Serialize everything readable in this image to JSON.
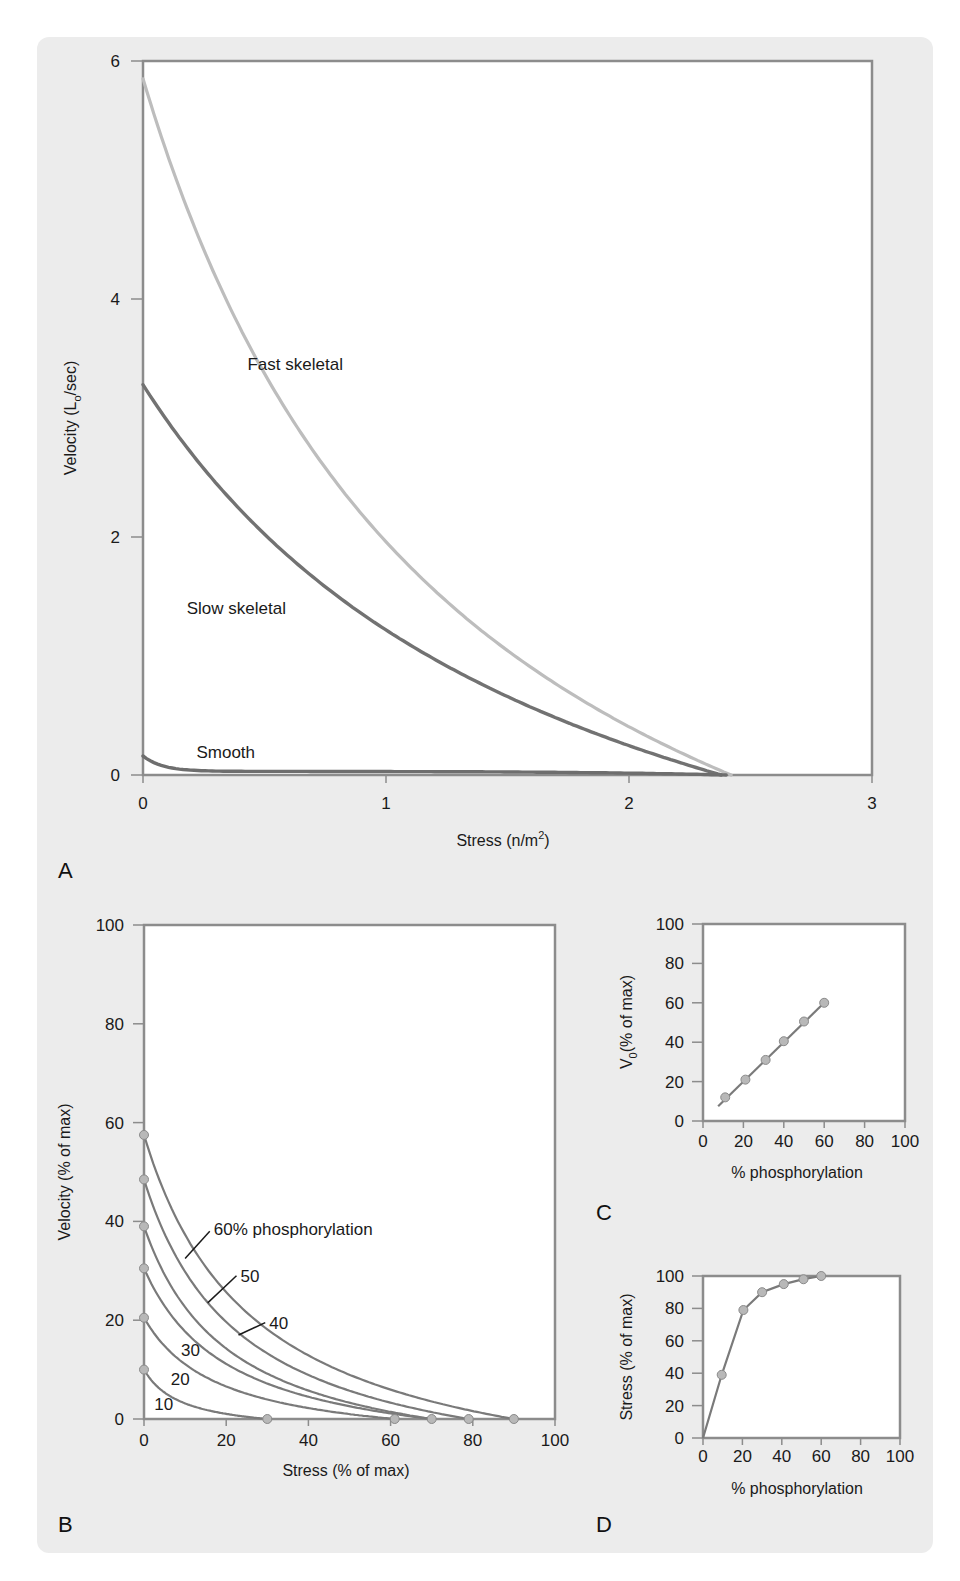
{
  "figure": {
    "background": "#ececec",
    "axis_color": "#8c8c8c",
    "curve_color": "#7a7a7a",
    "fast_color": "#bdbdbd",
    "slow_color": "#727272",
    "smooth_color": "#6e6e6e"
  },
  "chart_data": [
    {
      "id": "A",
      "panel_letter": "A",
      "type": "line",
      "title": "",
      "xlabel": "Stress (n/m",
      "xlabel_sup": "2",
      "xlabel_end": ")",
      "ylabel": "Velocity (L",
      "ylabel_sub": "o",
      "ylabel_end": "/sec)",
      "xlim": [
        0,
        3
      ],
      "ylim": [
        0,
        6
      ],
      "xticks": [
        0,
        1,
        2,
        3
      ],
      "yticks": [
        0,
        2,
        4,
        6
      ],
      "grid": false,
      "series": [
        {
          "name": "Fast skeletal",
          "v0": 5.85,
          "f0": 2.42,
          "a": 0.55,
          "color": "#bdbdbd",
          "x": [
            0,
            0.25,
            0.5,
            1.0,
            1.5,
            2.0,
            2.42
          ],
          "y": [
            5.85,
            4.1,
            2.95,
            1.6,
            0.8,
            0.3,
            0
          ]
        },
        {
          "name": "Slow skeletal",
          "v0": 3.28,
          "f0": 2.38,
          "a": 0.75,
          "color": "#727272",
          "x": [
            0,
            0.25,
            0.5,
            1.0,
            1.5,
            2.0,
            2.38
          ],
          "y": [
            3.28,
            2.5,
            1.95,
            1.1,
            0.55,
            0.18,
            0
          ]
        },
        {
          "name": "Smooth",
          "v0": 0.16,
          "f0": 2.4,
          "a": 0.03,
          "color": "#6e6e6e",
          "x": [
            0,
            0.1,
            0.3,
            1.0,
            2.0,
            2.4
          ],
          "y": [
            0.16,
            0.07,
            0.04,
            0.03,
            0.01,
            0
          ]
        }
      ],
      "annotations": [
        {
          "text": "Fast skeletal",
          "x": 0.43,
          "y": 3.45
        },
        {
          "text": "Slow skeletal",
          "x": 0.18,
          "y": 1.4
        },
        {
          "text": "Smooth",
          "x": 0.22,
          "y": 0.19
        }
      ]
    },
    {
      "id": "B",
      "panel_letter": "B",
      "type": "line",
      "title": "",
      "xlabel": "Stress (% of max)",
      "ylabel": "Velocity (% of max)",
      "xlim": [
        0,
        100
      ],
      "ylim": [
        0,
        100
      ],
      "xticks": [
        0,
        20,
        40,
        60,
        80,
        100
      ],
      "yticks": [
        0,
        20,
        40,
        60,
        80,
        100
      ],
      "grid": false,
      "series": [
        {
          "name": "10",
          "v0": 10,
          "f0": 30,
          "a": 0.3
        },
        {
          "name": "20",
          "v0": 20.5,
          "f0": 61,
          "a": 0.3
        },
        {
          "name": "30",
          "v0": 30.5,
          "f0": 70,
          "a": 0.3
        },
        {
          "name": "40",
          "v0": 39,
          "f0": 70,
          "a": 0.3
        },
        {
          "name": "50",
          "v0": 48.5,
          "f0": 79,
          "a": 0.3
        },
        {
          "name": "60% phosphorylation",
          "v0": 57.5,
          "f0": 90,
          "a": 0.3
        }
      ],
      "endpoint_markers": [
        {
          "x": 0,
          "y": 10
        },
        {
          "x": 0,
          "y": 20.5
        },
        {
          "x": 0,
          "y": 30.5
        },
        {
          "x": 0,
          "y": 39
        },
        {
          "x": 0,
          "y": 48.5
        },
        {
          "x": 0,
          "y": 57.5
        },
        {
          "x": 30,
          "y": 0
        },
        {
          "x": 61,
          "y": 0
        },
        {
          "x": 70,
          "y": 0
        },
        {
          "x": 79,
          "y": 0
        },
        {
          "x": 90,
          "y": 0
        }
      ],
      "labels": [
        {
          "text": "60% phosphorylation",
          "x": 17,
          "y": 38.5,
          "leader": [
            [
              10,
              32.5
            ],
            [
              16,
              38
            ]
          ]
        },
        {
          "text": "50",
          "x": 23.5,
          "y": 29,
          "leader": [
            [
              15.5,
              23.5
            ],
            [
              22.5,
              29
            ]
          ]
        },
        {
          "text": "40",
          "x": 30.5,
          "y": 19.5,
          "leader": [
            [
              23,
              17
            ],
            [
              29.5,
              19.5
            ]
          ]
        },
        {
          "text": "30",
          "x": 9,
          "y": 14
        },
        {
          "text": "20",
          "x": 6.5,
          "y": 8
        },
        {
          "text": "10",
          "x": 2.5,
          "y": 3
        }
      ]
    },
    {
      "id": "C",
      "panel_letter": "C",
      "type": "scatter",
      "title": "",
      "xlabel": "% phosphorylation",
      "ylabel": "V",
      "ylabel_sub": "0",
      "ylabel_end": "(% of max)",
      "xlim": [
        0,
        100
      ],
      "ylim": [
        0,
        100
      ],
      "xticks": [
        0,
        20,
        40,
        60,
        80,
        100
      ],
      "yticks": [
        0,
        20,
        40,
        60,
        80,
        100
      ],
      "grid": false,
      "x": [
        11,
        21,
        31,
        40,
        50,
        60
      ],
      "y": [
        12,
        21,
        31,
        40.5,
        50.5,
        60
      ],
      "fit_line": [
        [
          7.5,
          7.5
        ],
        [
          60,
          60
        ]
      ]
    },
    {
      "id": "D",
      "panel_letter": "D",
      "type": "line",
      "title": "",
      "xlabel": "% phosphorylation",
      "ylabel": "Stress (% of max)",
      "xlim": [
        0,
        100
      ],
      "ylim": [
        0,
        100
      ],
      "xticks": [
        0,
        20,
        40,
        60,
        80,
        100
      ],
      "yticks": [
        0,
        20,
        40,
        60,
        80,
        100
      ],
      "grid": false,
      "x": [
        0,
        9.5,
        20.5,
        30,
        41,
        51,
        60
      ],
      "y": [
        0,
        39,
        79,
        90,
        95,
        98,
        100
      ]
    }
  ]
}
